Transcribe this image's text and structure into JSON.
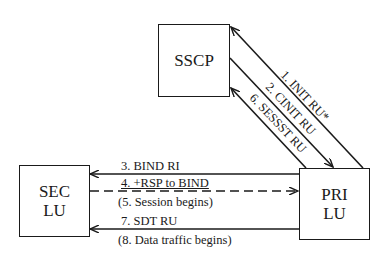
{
  "nodes": {
    "sscp": {
      "label": "SSCP"
    },
    "sec_lu": {
      "line1": "SEC",
      "line2": "LU"
    },
    "pri_lu": {
      "line1": "PRI",
      "line2": "LU"
    }
  },
  "messages": {
    "m1": "1. INIT RU*",
    "m2": "2. CINIT RU",
    "m6": "6. SESSST RU",
    "m3": "3. BIND RI",
    "m4": "4. +RSP to BIND",
    "m5": "(5. Session begins)",
    "m7": "7. SDT RU",
    "m8": "(8. Data traffic begins)"
  }
}
